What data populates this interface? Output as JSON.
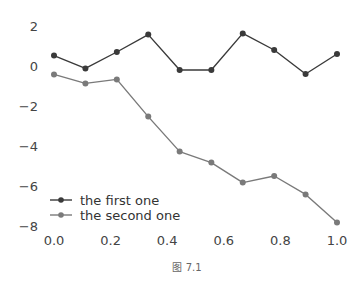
{
  "chart_data": {
    "type": "line",
    "title": "",
    "xlabel": "",
    "ylabel": "",
    "xlim": [
      0.0,
      1.0
    ],
    "ylim": [
      -8.2,
      2.3
    ],
    "grid": false,
    "legend_position": "lower left",
    "x": [
      0.0,
      0.111,
      0.222,
      0.333,
      0.444,
      0.556,
      0.667,
      0.778,
      0.889,
      1.0
    ],
    "series": [
      {
        "name": "the first one",
        "color": "#3a3a3a",
        "marker": "circle",
        "values": [
          0.52,
          -0.12,
          0.7,
          1.57,
          -0.2,
          -0.2,
          1.63,
          0.8,
          -0.4,
          0.6
        ]
      },
      {
        "name": "the second one",
        "color": "#7a7a7a",
        "marker": "circle",
        "values": [
          -0.42,
          -0.87,
          -0.67,
          -2.53,
          -4.28,
          -4.83,
          -5.83,
          -5.5,
          -6.42,
          -7.83
        ]
      }
    ],
    "xticks": [
      "0.0",
      "0.2",
      "0.4",
      "0.6",
      "0.8",
      "1.0"
    ],
    "yticks": [
      "2",
      "0",
      "−2",
      "−4",
      "−6",
      "−8"
    ],
    "caption": "图 7.1"
  }
}
